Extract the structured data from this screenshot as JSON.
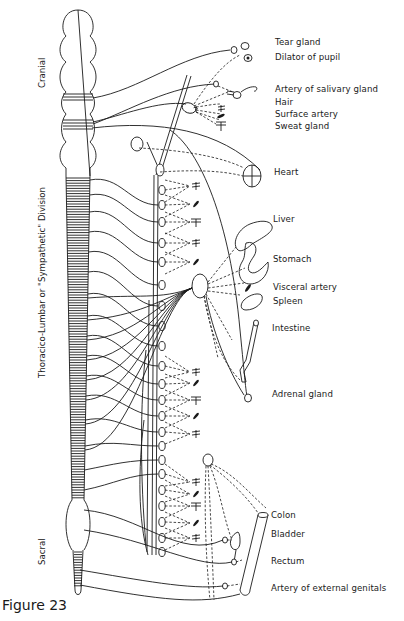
{
  "figure": {
    "caption": "Figure 23",
    "type": "anatomical diagram"
  },
  "regions": {
    "cranial": "Cranial",
    "thoraco_lumbar": "Thoracico-Lumbar or \"Sympathetic\" Division",
    "sacral": "Sacral"
  },
  "targets": [
    {
      "id": "tear-gland",
      "label": "Tear gland"
    },
    {
      "id": "dilator-of-pupil",
      "label": "Dilator of pupil"
    },
    {
      "id": "artery-of-salivary-gland",
      "label": "Artery of salivary gland"
    },
    {
      "id": "hair",
      "label": "Hair"
    },
    {
      "id": "surface-artery",
      "label": "Surface artery"
    },
    {
      "id": "sweat-gland",
      "label": "Sweat gland"
    },
    {
      "id": "heart",
      "label": "Heart"
    },
    {
      "id": "liver",
      "label": "Liver"
    },
    {
      "id": "stomach",
      "label": "Stomach"
    },
    {
      "id": "visceral-artery",
      "label": "Visceral artery"
    },
    {
      "id": "spleen",
      "label": "Spleen"
    },
    {
      "id": "intestine",
      "label": "Intestine"
    },
    {
      "id": "adrenal-gland",
      "label": "Adrenal gland"
    },
    {
      "id": "colon",
      "label": "Colon"
    },
    {
      "id": "bladder",
      "label": "Bladder"
    },
    {
      "id": "rectum",
      "label": "Rectum"
    },
    {
      "id": "artery-of-external-genitals",
      "label": "Artery of external genitals"
    }
  ],
  "colors": {
    "ink": "#1a1a1a",
    "paper": "#ffffff"
  }
}
